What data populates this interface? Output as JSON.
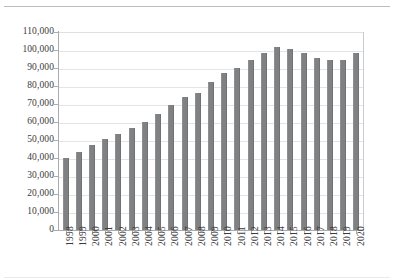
{
  "chart_data": {
    "type": "bar",
    "title": "",
    "subtitle": "",
    "xlabel": "",
    "ylabel": "",
    "ylim": [
      0,
      110000
    ],
    "ytick_step": 10000,
    "ytick_labels": [
      "110,000",
      "100,000",
      "90,000",
      "80,000",
      "70,000",
      "60,000",
      "50,000",
      "40,000",
      "30,000",
      "20,000",
      "10,000",
      "0"
    ],
    "ytick_values": [
      110000,
      100000,
      90000,
      80000,
      70000,
      60000,
      50000,
      40000,
      30000,
      20000,
      10000,
      0
    ],
    "grid": true,
    "grid_axis": "y",
    "legend": false,
    "legend_position": "none",
    "bar_color": "#7f8183",
    "categories": [
      "1998",
      "1999",
      "2000",
      "2001",
      "2002",
      "2003",
      "2004",
      "2005",
      "2006",
      "2007",
      "2008",
      "2009",
      "2010",
      "2011",
      "2012",
      "2013",
      "2014",
      "2015",
      "2016",
      "2017",
      "2018",
      "2019",
      "2020"
    ],
    "values": [
      40000,
      43500,
      47500,
      50500,
      53500,
      56500,
      60000,
      64500,
      69500,
      74000,
      76000,
      82500,
      87500,
      90000,
      94500,
      98500,
      101500,
      100500,
      98500,
      95500,
      94500,
      94500,
      98500
    ],
    "series": [
      {
        "name": "Series 1",
        "values": [
          40000,
          43500,
          47500,
          50500,
          53500,
          56500,
          60000,
          64500,
          69500,
          74000,
          76000,
          82500,
          87500,
          90000,
          94500,
          98500,
          101500,
          100500,
          98500,
          95500,
          94500,
          94500,
          98500
        ]
      }
    ]
  },
  "colors": {
    "bar": "#7f8183",
    "gridline": "#e3e4e6",
    "axis": "#a9abad",
    "text": "#3b3b3b",
    "background": "#ffffff",
    "rule": "#b9bcc0"
  }
}
